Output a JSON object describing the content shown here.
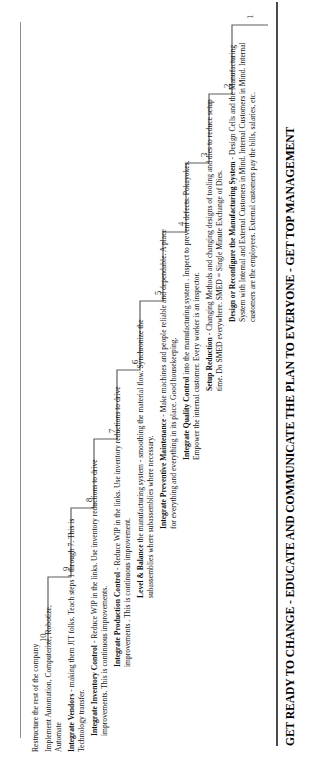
{
  "document": {
    "orientation": "rotated-90-ccw",
    "footer_banner": "GET READY TO CHANGE - EDUCATE AND COMMUNICATE THE PLAN TO EVERYONE - GET TOP MANAGEMENT",
    "ink_color": "#1a1a1a",
    "rule_color": "#6d6d6d",
    "background": "#ffffff"
  },
  "staircase": {
    "steps": [
      {
        "number": "1",
        "lead": "Design or Reconfigure the Manufacturing System",
        "body": " - Design Cells and the Manufacturing System with Internal and External Customers in Mind. Internal Customers in Mind. Internal customers are the employees. External customers pay the bills, salaries, etc."
      },
      {
        "number": "2",
        "lead": "Setup Reduction",
        "body": " - Changing Methods and changing designs of tooling and dies to reduce setup time. Do SMED everywhere. SMED = Single Minute Exchange of Dies."
      },
      {
        "number": "3",
        "lead": "Integrate Quality Control",
        "body": " into the manufacturing system . Inspect to prevent defects. Pokayokes. Empower the internal customer. Every worker is an inspector."
      },
      {
        "number": "4",
        "lead": "Integrate Preventive Maintenance",
        "body": " - Make  machines and people reliable and dependable. A place for everything and everything in its place. Good housekeeping."
      },
      {
        "number": "5",
        "lead": "Level & Balance",
        "body": " the manufacturing system - smoothing the material flow. Synchronize the subassemblies where subassemblies where necessary."
      },
      {
        "number": "6",
        "lead": "Integrate Production Control",
        "body": " - Reduce WIP in the links. Use inventory reductions to drive improvements . This is continuous improvement."
      },
      {
        "number": "7",
        "lead": "Integrate Inventory Control",
        "body": " - Reduce WIP in the links. Use inventory reductions to drive improvements. This is continuous improvements."
      },
      {
        "number": "8",
        "lead": "Integrate Vendors",
        "body": " - making them JIT folks. Teach steps 1 through 7. This is Technology  transfer."
      },
      {
        "number": "9",
        "lead": "",
        "body": "Implement Automation, Computerize, Robotize, Automate"
      },
      {
        "number": "10",
        "lead": "",
        "body": "Restructure the rest of the company"
      }
    ]
  }
}
